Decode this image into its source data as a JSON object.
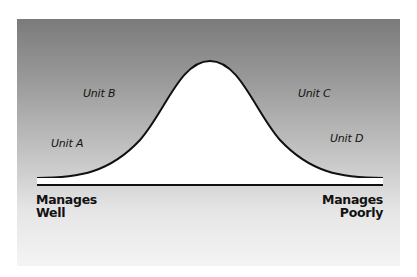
{
  "diagram": {
    "type": "bell-curve",
    "colors": {
      "panel_top": "#7b7b7b",
      "panel_bottom": "#f4f4f4",
      "curve_fill": "#ffffff",
      "curve_stroke": "#111111",
      "baseline": "#111111",
      "text": "#111111"
    },
    "units": [
      {
        "label": "Unit A"
      },
      {
        "label": "Unit B"
      },
      {
        "label": "Unit C"
      },
      {
        "label": "Unit D"
      }
    ],
    "axis": {
      "left_line1": "Manages",
      "left_line2": "Well",
      "right_line1": "Manages",
      "right_line2": "Poorly"
    }
  }
}
